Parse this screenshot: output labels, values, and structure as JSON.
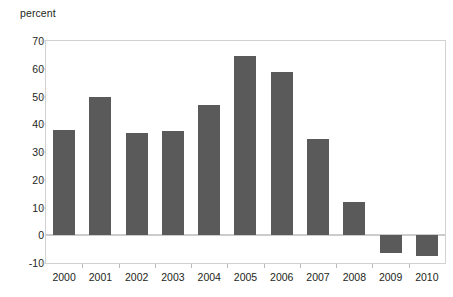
{
  "chart_data": {
    "type": "bar",
    "title": "",
    "subtitle": "",
    "xlabel": "",
    "ylabel": "percent",
    "unit_label": "percent",
    "categories": [
      "2000",
      "2001",
      "2002",
      "2003",
      "2004",
      "2005",
      "2006",
      "2007",
      "2008",
      "2009",
      "2010"
    ],
    "values": [
      38,
      50,
      37,
      37.7,
      47,
      64.5,
      58.8,
      34.6,
      12.1,
      -6.5,
      -7.6
    ],
    "series": [
      {
        "name": "percent",
        "values": [
          38,
          50,
          37,
          37.7,
          47,
          64.5,
          58.8,
          34.6,
          12.1,
          -6.5,
          -7.6
        ]
      }
    ],
    "ylim": [
      -10,
      70
    ],
    "ytick_values": [
      70,
      60,
      50,
      40,
      30,
      20,
      10,
      0,
      -10
    ],
    "ytick_labels": [
      "70",
      "60",
      "50",
      "40",
      "30",
      "20",
      "10",
      "0",
      "-10"
    ],
    "grid": false,
    "legend": false,
    "legend_position": "none",
    "bar_color": "#5a5a5a",
    "axis_color": "#b9b9bb",
    "zero_line_color": "#9a9a9c",
    "background_color": "#ffffff",
    "text_color": "#231f20"
  }
}
